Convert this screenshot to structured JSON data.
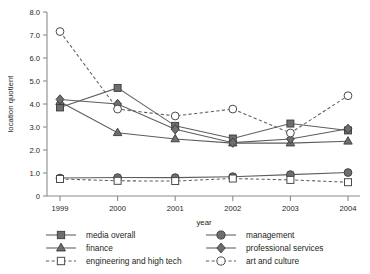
{
  "chart_data": {
    "type": "line",
    "title": "",
    "xlabel": "year",
    "ylabel": "location quotient",
    "categories": [
      "1999",
      "2000",
      "2001",
      "2002",
      "2003",
      "2004"
    ],
    "x": [
      1999,
      2000,
      2001,
      2002,
      2003,
      2004
    ],
    "xlim": [
      1999,
      2004
    ],
    "ylim": [
      0,
      8.0
    ],
    "yticks": [
      "0",
      "1.0",
      "2.0",
      "3.0",
      "4.0",
      "5.0",
      "6.0",
      "7.0",
      "8.0"
    ],
    "ytick_values": [
      0,
      1.0,
      2.0,
      3.0,
      4.0,
      5.0,
      6.0,
      7.0,
      8.0
    ],
    "grid": false,
    "legend_position": "below",
    "series": [
      {
        "name": "media overall",
        "marker": "filled-square",
        "linestyle": "solid",
        "values": [
          3.85,
          4.7,
          3.05,
          2.5,
          3.15,
          2.85
        ]
      },
      {
        "name": "management",
        "marker": "filled-circle",
        "linestyle": "solid",
        "values": [
          0.78,
          0.8,
          0.8,
          0.84,
          0.93,
          1.02
        ]
      },
      {
        "name": "finance",
        "marker": "filled-triangle",
        "linestyle": "solid",
        "values": [
          4.1,
          2.75,
          2.48,
          2.3,
          2.3,
          2.38
        ]
      },
      {
        "name": "professional services",
        "marker": "filled-diamond",
        "linestyle": "solid",
        "values": [
          4.2,
          4.0,
          2.9,
          2.32,
          2.48,
          2.92
        ]
      },
      {
        "name": "engineering and high tech",
        "marker": "open-square",
        "linestyle": "dashed",
        "values": [
          0.74,
          0.66,
          0.65,
          0.76,
          0.7,
          0.6
        ]
      },
      {
        "name": "art and culture",
        "marker": "open-circle",
        "linestyle": "dashed",
        "values": [
          7.15,
          3.78,
          3.48,
          3.78,
          2.74,
          4.36
        ]
      }
    ]
  },
  "legend": {
    "entries": [
      {
        "label": "media overall",
        "marker": "filled-square",
        "linestyle": "solid"
      },
      {
        "label": "management",
        "marker": "filled-circle",
        "linestyle": "solid"
      },
      {
        "label": "finance",
        "marker": "filled-triangle",
        "linestyle": "solid"
      },
      {
        "label": "professional services",
        "marker": "filled-diamond",
        "linestyle": "solid"
      },
      {
        "label": "engineering and high tech",
        "marker": "open-square",
        "linestyle": "dashed"
      },
      {
        "label": "art and culture",
        "marker": "open-circle",
        "linestyle": "dashed"
      }
    ]
  },
  "colors": {
    "line": "#5d5d5d",
    "marker_fill": "#6e6e6e",
    "marker_stroke": "#3a3a3a",
    "axis": "#8c8c8c",
    "text": "#231f20",
    "background": "#ffffff"
  }
}
